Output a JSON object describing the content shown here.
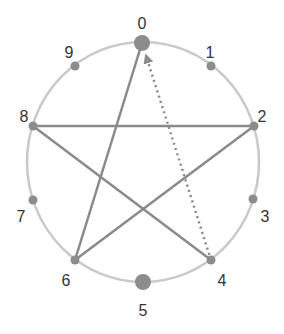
{
  "diagram": {
    "type": "circular-graph",
    "colors": {
      "ring": "#c9c9c9",
      "edge": "#8a8a8a",
      "node": "#8c8c8c",
      "label": "#333333"
    },
    "ring": {
      "cx": 143,
      "cy": 162,
      "rx": 116,
      "ry": 120
    },
    "nodes": [
      {
        "id": "0",
        "label": "0",
        "x": 142,
        "y": 43,
        "r": 8,
        "lx": 142,
        "ly": 25
      },
      {
        "id": "1",
        "label": "1",
        "x": 211,
        "y": 66,
        "r": 4.5,
        "lx": 210,
        "ly": 54
      },
      {
        "id": "2",
        "label": "2",
        "x": 254,
        "y": 126,
        "r": 4.5,
        "lx": 262,
        "ly": 118
      },
      {
        "id": "3",
        "label": "3",
        "x": 253,
        "y": 199,
        "r": 4.5,
        "lx": 265,
        "ly": 218
      },
      {
        "id": "4",
        "label": "4",
        "x": 211,
        "y": 260,
        "r": 4.5,
        "lx": 222,
        "ly": 282
      },
      {
        "id": "5",
        "label": "5",
        "x": 143,
        "y": 282,
        "r": 8,
        "lx": 143,
        "ly": 312
      },
      {
        "id": "6",
        "label": "6",
        "x": 75,
        "y": 260,
        "r": 4.5,
        "lx": 66,
        "ly": 282
      },
      {
        "id": "7",
        "label": "7",
        "x": 33,
        "y": 200,
        "r": 4.5,
        "lx": 21,
        "ly": 218
      },
      {
        "id": "8",
        "label": "8",
        "x": 33,
        "y": 126,
        "r": 4.5,
        "lx": 24,
        "ly": 118
      },
      {
        "id": "9",
        "label": "9",
        "x": 75,
        "y": 66,
        "r": 4.5,
        "lx": 69,
        "ly": 54
      }
    ],
    "edges": [
      {
        "from": "0",
        "to": "6",
        "style": "solid"
      },
      {
        "from": "6",
        "to": "2",
        "style": "solid"
      },
      {
        "from": "2",
        "to": "8",
        "style": "solid"
      },
      {
        "from": "8",
        "to": "4",
        "style": "solid"
      },
      {
        "from": "4",
        "to": "0",
        "style": "dotted",
        "arrow": "end"
      }
    ]
  }
}
